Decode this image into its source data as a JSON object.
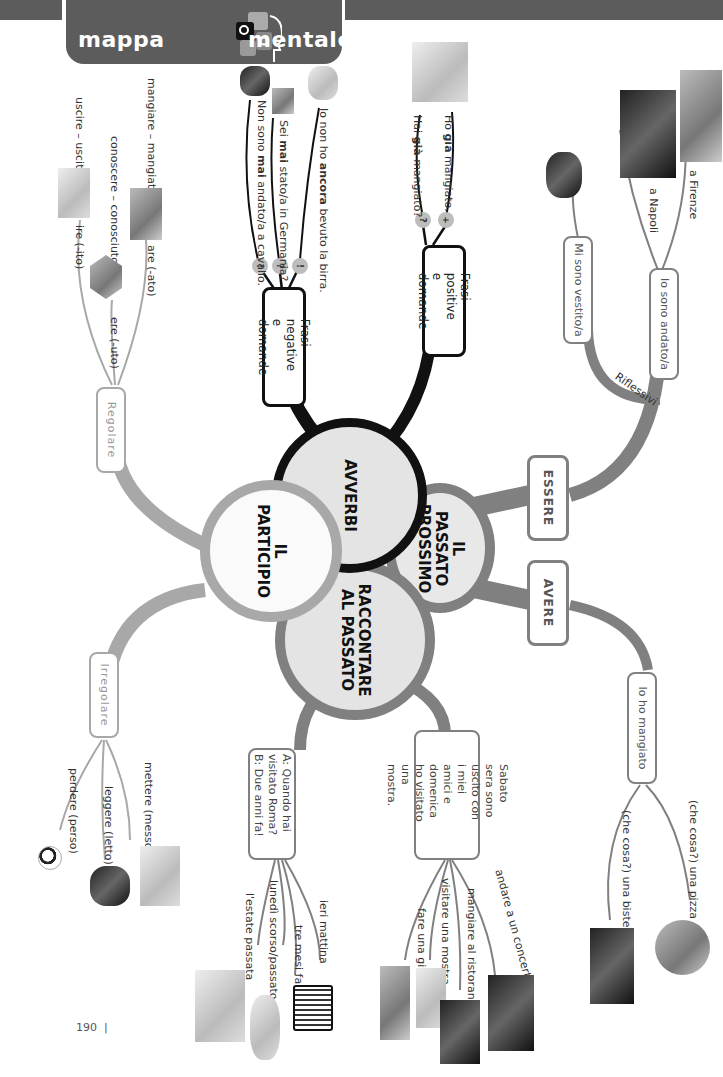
{
  "header": {
    "title_left": "mappa",
    "title_right": "mentale",
    "icon": "puzzle-head-icon"
  },
  "center": {
    "avverbi": "AVVERBI",
    "passato_prossimo": "IL PASSATO PROSSIMO",
    "participio": "IL PARTICIPIO",
    "raccontare": "RACCONTARE AL PASSATO"
  },
  "avverbi_branch": {
    "positive_box": "Frasi positive e domande",
    "positive_items": [
      {
        "badge": "+",
        "text_html": "Ho già mangiato."
      },
      {
        "badge": "?",
        "text_html": "Hai già mangiato?"
      }
    ],
    "negative_box": "Frasi negative e domande",
    "negative_items": [
      {
        "badge": "!",
        "text": "Io non ho ancora bevuto la birra."
      },
      {
        "badge": "?",
        "text": "Sei mai stato/a in Germania?"
      },
      {
        "badge": "!",
        "text": "Non sono mai andato/a a cavallo."
      }
    ]
  },
  "passato_branch": {
    "essere": "ESSERE",
    "avere": "AVERE",
    "riflessivi_label": "Riflessivi",
    "vestito_box": "Mi sono vestito/a",
    "andato_box": "Io sono andato/a",
    "andato_items": [
      "a Firenze",
      "a Napoli"
    ],
    "mangiato_box": "Io ho mangiato",
    "mangiato_items": [
      "(che cosa?) una pizza",
      "(che cosa?) una bistecca"
    ]
  },
  "participio_branch": {
    "regolare_box": "Regolare",
    "regolare_items": [
      "are (-ato)",
      "ere (-uto)",
      "ire (-ito)"
    ],
    "regolare_examples": [
      "mangiare – mangiato",
      "conoscere – conosciuto",
      "uscire – uscito"
    ],
    "irregolare_box": "Irregolare",
    "irregolare_items": [
      "mettere (messo)",
      "leggere (letto)",
      "perdere (perso)"
    ]
  },
  "raccontare_branch": {
    "story_box": "Sabato sera sono uscito con i miei amici e domenica ho visitato una mostra.",
    "story_items": [
      "andare a un concerto",
      "mangiare al ristorante",
      "visitare una mostra",
      "fare una gita"
    ],
    "dialog_box_a": "A: Quando hai visitato Roma?",
    "dialog_box_b": "B: Due anni fa!",
    "dialog_items": [
      "ieri mattina",
      "tre mesi fa",
      "lunedì scorso/passato",
      "l'estate passata"
    ]
  },
  "footer": {
    "page_number": "190"
  },
  "colors": {
    "banner": "#5c5c5c",
    "black_branch": "#111111",
    "gray_branch": "#808080",
    "light_branch": "#a8a8a8",
    "circle_fill": "#e4e4e4"
  }
}
